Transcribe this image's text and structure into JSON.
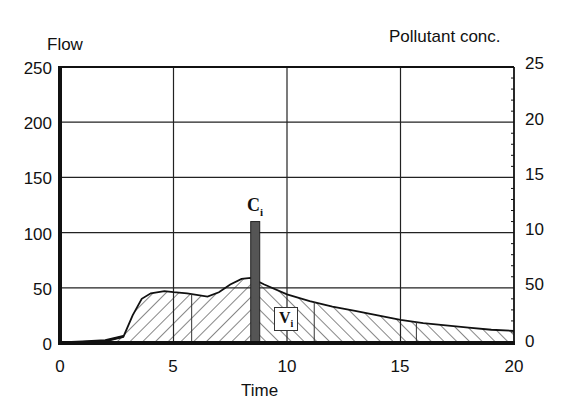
{
  "chart_data": {
    "type": "area",
    "title": "",
    "xlabel": "Time",
    "ylabel_left": "Flow",
    "ylabel_right": "Pollutant conc.",
    "xlim": [
      0,
      20
    ],
    "ylim_left": [
      0,
      250
    ],
    "ylim_right": [
      0,
      25
    ],
    "x_ticks": [
      "0",
      "5",
      "10",
      "15",
      "20"
    ],
    "y_ticks_left": [
      "0",
      "50",
      "100",
      "150",
      "200",
      "250"
    ],
    "y_ticks_right": [
      "0",
      "50",
      "10",
      "15",
      "20",
      "25"
    ],
    "grid": true,
    "legend": null,
    "series": [
      {
        "name": "Flow hydrograph (hatched volume)",
        "type": "area",
        "x": [
          0,
          1,
          2,
          2.8,
          3.2,
          3.6,
          4.0,
          4.6,
          5.0,
          5.6,
          6.5,
          7.0,
          7.5,
          8.0,
          8.4,
          8.6,
          9.0,
          10.0,
          11.0,
          12.0,
          13.0,
          14.0,
          15.0,
          16.0,
          17.0,
          18.0,
          19.0,
          20.0
        ],
        "values": [
          0,
          1,
          2,
          6,
          25,
          40,
          45,
          47,
          46,
          45,
          42,
          46,
          53,
          58,
          59,
          57,
          53,
          44,
          38,
          33,
          29,
          25,
          21,
          18,
          16,
          14,
          12,
          11
        ]
      },
      {
        "name": "C_i (pollutant concentration pulse)",
        "type": "bar",
        "x": [
          8.6
        ],
        "values": [
          11
        ],
        "axis": "right"
      }
    ],
    "sub_volume_boundaries_x": [
      5.8,
      11.2,
      15.7
    ],
    "annotations": [
      {
        "text": "C",
        "subscript": "i",
        "x": 8.6,
        "y_flow": 125
      },
      {
        "text": "V",
        "subscript": "i",
        "x": 10.0,
        "y_flow": 22
      }
    ]
  },
  "labels": {
    "flow": "Flow",
    "conc": "Pollutant conc.",
    "time": "Time",
    "ci_main": "C",
    "ci_sub": "i",
    "vi_main": "V",
    "vi_sub": "i"
  },
  "ticks": {
    "left": [
      "250",
      "200",
      "150",
      "100",
      "50",
      "0"
    ],
    "right": [
      "25",
      "20",
      "15",
      "10",
      "50",
      "0"
    ],
    "x": [
      "0",
      "5",
      "10",
      "15",
      "20"
    ]
  }
}
